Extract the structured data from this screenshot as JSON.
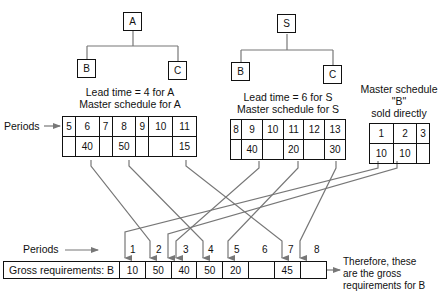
{
  "tree_a": {
    "parent": "A",
    "left": "B",
    "right": "C",
    "caption_line1": "Lead time = 4 for A",
    "caption_line2": "Master schedule for A"
  },
  "tree_s": {
    "parent": "S",
    "left": "B",
    "right": "C",
    "caption_line1": "Lead time = 6 for S",
    "caption_line2": "Master schedule for S"
  },
  "b_direct": {
    "caption_line1": "Master schedule",
    "caption_line2": "\"B\"",
    "caption_line3": "sold directly"
  },
  "periods_label": "Periods",
  "schedule_a": {
    "periods": [
      "5",
      "6",
      "7",
      "8",
      "9",
      "10",
      "11"
    ],
    "quantities": [
      "",
      "40",
      "",
      "50",
      "",
      "",
      "15"
    ]
  },
  "schedule_s": {
    "periods": [
      "8",
      "9",
      "10",
      "11",
      "12",
      "13"
    ],
    "quantities": [
      "",
      "40",
      "",
      "20",
      "",
      "30"
    ]
  },
  "schedule_b": {
    "periods": [
      "1",
      "2",
      "3"
    ],
    "quantities": [
      "10",
      "10",
      ""
    ]
  },
  "gross": {
    "label": "Gross requirements: B",
    "periods": [
      "1",
      "2",
      "3",
      "4",
      "5",
      "6",
      "7",
      "8"
    ],
    "values": [
      "10",
      "50",
      "40",
      "50",
      "20",
      "",
      "45",
      ""
    ]
  },
  "note": {
    "line1": "Therefore, these",
    "line2": "are the gross",
    "line3": "requirements for B"
  },
  "colors": {
    "line": "#111111",
    "arrow": "#777777"
  }
}
